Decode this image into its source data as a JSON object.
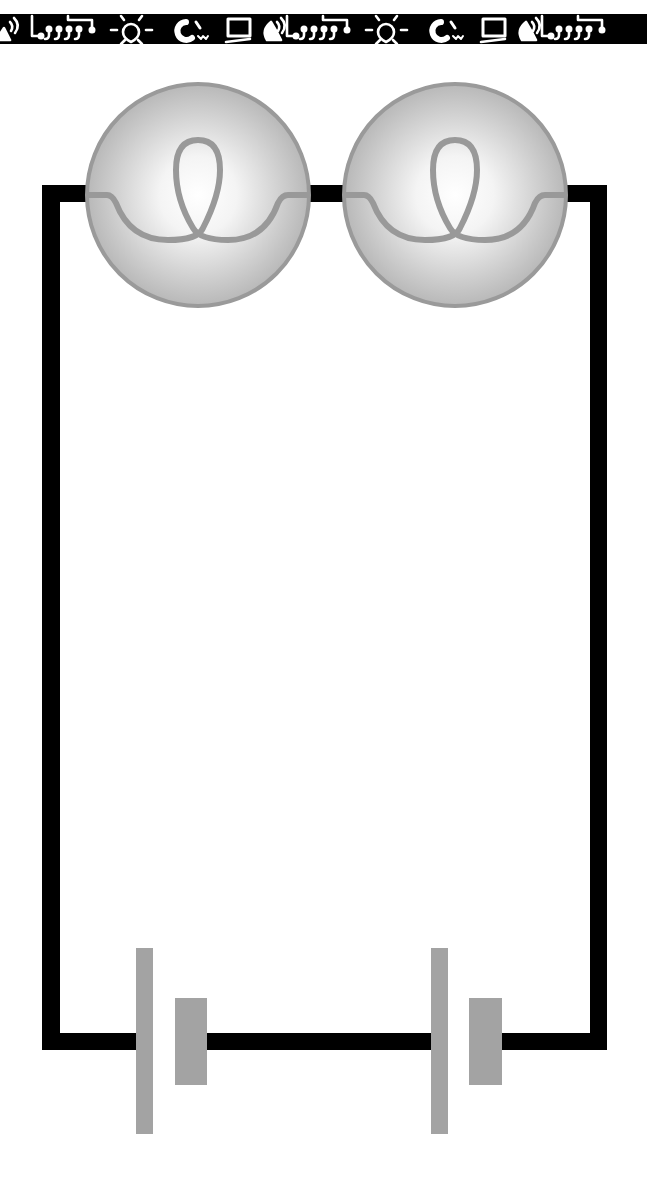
{
  "diagram": {
    "type": "circuit-schematic",
    "colors": {
      "background": "#ffffff",
      "wire": "#000000",
      "component": "#a0a0a0",
      "bulb_outline": "#9a9a9a",
      "bulb_glow_center": "#ffffff",
      "bulb_glow_edge": "#b4b4b4",
      "banner_bg": "#000000",
      "banner_icon": "#ffffff"
    },
    "banner": {
      "icons": [
        "satellite-dish-icon",
        "circuit-board-icon",
        "light-bulb-icon",
        "magnet-icon",
        "computer-monitor-icon",
        "satellite-dish-icon",
        "circuit-board-icon",
        "light-bulb-icon",
        "magnet-icon",
        "computer-monitor-icon",
        "satellite-dish-icon",
        "circuit-board-icon"
      ]
    },
    "components": {
      "bulbs": [
        {
          "id": "bulb-1",
          "cx": 198,
          "cy": 195,
          "r": 112
        },
        {
          "id": "bulb-2",
          "cx": 455,
          "cy": 195,
          "r": 112
        }
      ],
      "cells": [
        {
          "id": "cell-1",
          "long_plate_x": 136,
          "short_plate_x": 175
        },
        {
          "id": "cell-2",
          "long_plate_x": 431,
          "short_plate_x": 469
        }
      ]
    }
  }
}
